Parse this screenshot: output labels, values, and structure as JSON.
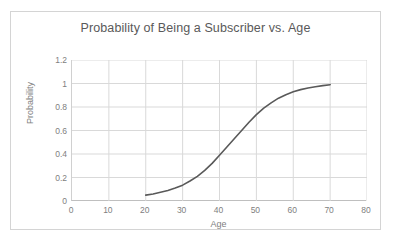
{
  "chart_data": {
    "type": "line",
    "title": "Probability of Being a Subscriber vs. Age",
    "xlabel": "Age",
    "ylabel": "Probability",
    "xlim": [
      0,
      80
    ],
    "ylim": [
      0,
      1.2
    ],
    "xticks": [
      "0",
      "10",
      "20",
      "30",
      "40",
      "50",
      "60",
      "70",
      "80"
    ],
    "yticks": [
      "0",
      "0.2",
      "0.4",
      "0.6",
      "0.8",
      "1",
      "1.2"
    ],
    "grid": true,
    "legend": "none",
    "series": [
      {
        "name": "Probability of Being a Subscriber",
        "color": "#595959",
        "x": [
          20,
          22,
          24,
          26,
          28,
          30,
          32,
          34,
          36,
          38,
          40,
          42,
          44,
          46,
          48,
          50,
          52,
          54,
          56,
          58,
          60,
          62,
          64,
          66,
          68,
          70
        ],
        "values": [
          0.05,
          0.06,
          0.075,
          0.09,
          0.11,
          0.135,
          0.17,
          0.21,
          0.26,
          0.32,
          0.39,
          0.46,
          0.53,
          0.6,
          0.67,
          0.735,
          0.79,
          0.835,
          0.875,
          0.905,
          0.93,
          0.948,
          0.962,
          0.973,
          0.982,
          0.99
        ]
      }
    ]
  },
  "colors": {
    "curve": "#595959",
    "gridline": "#d9d9d9",
    "axis": "#bfbfbf",
    "border": "#d4d4d4",
    "text": "#808080",
    "title_text": "#595959"
  }
}
